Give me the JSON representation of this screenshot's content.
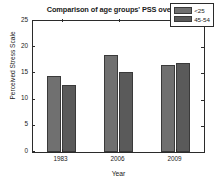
{
  "chart_data": {
    "type": "bar",
    "title": "Comparison of age groups' PSS over time",
    "xlabel": "Year",
    "ylabel": "Perceived Stress Scale",
    "categories": [
      "1983",
      "2006",
      "2009"
    ],
    "series": [
      {
        "name": "<25",
        "values": [
          14.6,
          18.6,
          16.7
        ],
        "color": "#707070"
      },
      {
        "name": "45-54",
        "values": [
          12.7,
          15.2,
          16.9
        ],
        "color": "#5a5a5a"
      }
    ],
    "ylim": [
      0,
      25
    ],
    "yticks": [
      0,
      5,
      10,
      15,
      20,
      25
    ],
    "ytick_labels": [
      "0",
      "5",
      "10",
      "15",
      "20",
      "25"
    ],
    "grid": false,
    "legend_position": "top-right",
    "background": "#ffffff",
    "axis_color": "#2b2b2b"
  }
}
